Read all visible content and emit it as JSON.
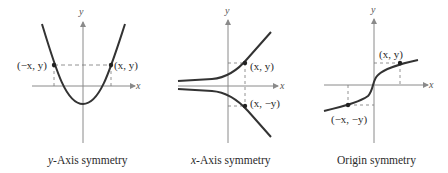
{
  "panels": [
    {
      "caption_var": "y",
      "caption_rest": "-Axis symmetry",
      "axis_x": "x",
      "axis_y": "y",
      "point_left": "(−x, y)",
      "point_right": "(x, y)"
    },
    {
      "caption_var": "x",
      "caption_rest": "-Axis symmetry",
      "axis_x": "x",
      "axis_y": "y",
      "point_upper": "(x, y)",
      "point_lower": "(x, −y)"
    },
    {
      "caption": "Origin symmetry",
      "axis_x": "x",
      "axis_y": "y",
      "point_upper": "(x, y)",
      "point_lower": "(−x, −y)"
    }
  ],
  "colors": {
    "curve": "#333333",
    "axis": "#8a8a8a",
    "dash": "#777777"
  }
}
